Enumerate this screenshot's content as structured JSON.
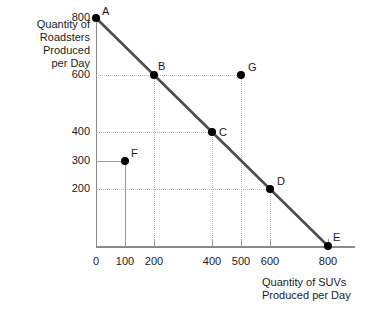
{
  "chart_data": {
    "type": "scatter",
    "title": "",
    "xlabel": "Quantity of SUVs\nProduced per Day",
    "ylabel": "Quantity of\nRoadsters\nProduced\nper Day",
    "xlim": [
      0,
      880
    ],
    "ylim": [
      0,
      880
    ],
    "xticks": [
      0,
      100,
      200,
      400,
      500,
      600,
      800
    ],
    "xtick_labels": [
      "0",
      "100",
      "200",
      "400",
      "500",
      "600",
      "800"
    ],
    "yticks": [
      200,
      300,
      400,
      600,
      800
    ],
    "ytick_labels": [
      "200",
      "300",
      "400",
      "600",
      "800"
    ],
    "grid": true,
    "legend": "none",
    "series": [
      {
        "name": "Production Possibilities Frontier",
        "type": "line",
        "color": "#4d4d4d",
        "x": [
          0,
          800
        ],
        "y": [
          800,
          0
        ]
      },
      {
        "name": "Labeled Points",
        "type": "scatter",
        "color": "#000000",
        "points": [
          {
            "label": "A",
            "x": 0,
            "y": 800,
            "on_frontier": true
          },
          {
            "label": "B",
            "x": 200,
            "y": 600,
            "on_frontier": true
          },
          {
            "label": "C",
            "x": 400,
            "y": 400,
            "on_frontier": true
          },
          {
            "label": "D",
            "x": 600,
            "y": 200,
            "on_frontier": true
          },
          {
            "label": "E",
            "x": 800,
            "y": 0,
            "on_frontier": true
          },
          {
            "label": "F",
            "x": 100,
            "y": 300,
            "on_frontier": false
          },
          {
            "label": "G",
            "x": 500,
            "y": 600,
            "on_frontier": false
          }
        ]
      }
    ]
  },
  "axes": {
    "y_title": "Quantity of\nRoadsters\nProduced\nper Day",
    "x_title": "Quantity of SUVs\nProduced per Day"
  }
}
